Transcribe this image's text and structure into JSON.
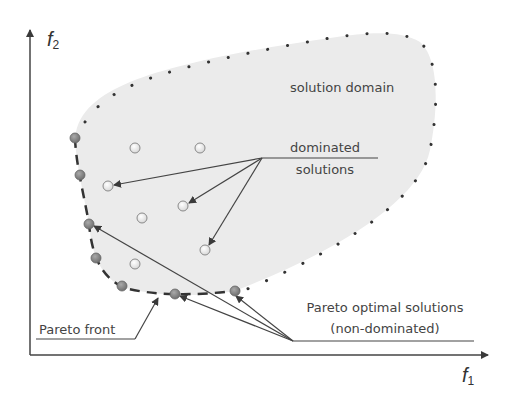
{
  "axes": {
    "x_label": "f",
    "x_subscript": "1",
    "y_label": "f",
    "y_subscript": "2"
  },
  "labels": {
    "solution_domain": "solution domain",
    "dominated_line1": "dominated",
    "dominated_line2": "solutions",
    "pareto_optimal_line1": "Pareto optimal solutions",
    "pareto_optimal_line2": "(non-dominated)",
    "pareto_front": "Pareto front"
  },
  "colors": {
    "domain_fill": "#ebebeb",
    "boundary": "#333333",
    "pareto_point": "#8a8a8a",
    "dominated_point": "#ffffff",
    "text": "#444444"
  },
  "points": {
    "pareto": [
      [
        75,
        138
      ],
      [
        80,
        175
      ],
      [
        89,
        224
      ],
      [
        96,
        258
      ],
      [
        122,
        286
      ],
      [
        175,
        294
      ],
      [
        235,
        291
      ]
    ],
    "dominated": [
      [
        135,
        148
      ],
      [
        200,
        148
      ],
      [
        108,
        186
      ],
      [
        183,
        206
      ],
      [
        142,
        218
      ],
      [
        205,
        250
      ],
      [
        135,
        264
      ]
    ]
  }
}
